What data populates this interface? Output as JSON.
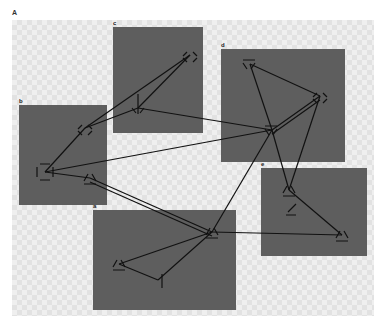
{
  "figure": {
    "panel_label": "A",
    "background": "#efefef",
    "cluster_color": "#5e5e5e",
    "edge_color": "#111111"
  },
  "clusters": [
    {
      "id": "a",
      "label": "a",
      "x": 93,
      "y": 210,
      "w": 143,
      "h": 100
    },
    {
      "id": "b",
      "label": "b",
      "x": 19,
      "y": 105,
      "w": 88,
      "h": 100
    },
    {
      "id": "c",
      "label": "c",
      "x": 113,
      "y": 27,
      "w": 90,
      "h": 106
    },
    {
      "id": "d",
      "label": "d",
      "x": 221,
      "y": 49,
      "w": 124,
      "h": 113
    },
    {
      "id": "e",
      "label": "e",
      "x": 261,
      "y": 168,
      "w": 106,
      "h": 88
    }
  ],
  "nodes": [
    {
      "id": "c1",
      "cluster": "c",
      "shape": "diamond",
      "x": 190,
      "y": 55
    },
    {
      "id": "c2",
      "cluster": "c",
      "shape": "arrow-down",
      "x": 138,
      "y": 108
    },
    {
      "id": "b1",
      "cluster": "b",
      "shape": "diamond",
      "x": 85,
      "y": 128
    },
    {
      "id": "b2",
      "cluster": "b",
      "shape": "square",
      "x": 45,
      "y": 172
    },
    {
      "id": "b3",
      "cluster": "b",
      "shape": "triangle",
      "x": 90,
      "y": 178
    },
    {
      "id": "d1",
      "cluster": "d",
      "shape": "triangle-down",
      "x": 250,
      "y": 64
    },
    {
      "id": "d2",
      "cluster": "d",
      "shape": "diamond",
      "x": 320,
      "y": 96
    },
    {
      "id": "d3",
      "cluster": "d",
      "shape": "triangle-down",
      "x": 272,
      "y": 130
    },
    {
      "id": "e1",
      "cluster": "e",
      "shape": "triangle",
      "x": 289,
      "y": 190
    },
    {
      "id": "e2",
      "cluster": "e",
      "shape": "z",
      "x": 292,
      "y": 208
    },
    {
      "id": "e3",
      "cluster": "e",
      "shape": "triangle",
      "x": 342,
      "y": 235
    },
    {
      "id": "a1",
      "cluster": "a",
      "shape": "triangle",
      "x": 212,
      "y": 232
    },
    {
      "id": "a2",
      "cluster": "a",
      "shape": "triangle",
      "x": 119,
      "y": 264
    },
    {
      "id": "a3",
      "cluster": "a",
      "shape": "triangle-side",
      "x": 158,
      "y": 280
    }
  ],
  "edges": [
    [
      "c1",
      "b1"
    ],
    [
      "c1",
      "c2"
    ],
    [
      "b1",
      "c2"
    ],
    [
      "c2",
      "d3"
    ],
    [
      "b2",
      "d3"
    ],
    [
      "b2",
      "b1"
    ],
    [
      "b2",
      "b3"
    ],
    [
      "b3",
      "a1"
    ],
    [
      "b3",
      "a1b"
    ],
    [
      "d1",
      "d3"
    ],
    [
      "d1",
      "d2"
    ],
    [
      "d2",
      "d3"
    ],
    [
      "d2",
      "d3b"
    ],
    [
      "d2",
      "e1"
    ],
    [
      "d3",
      "e1"
    ],
    [
      "d3",
      "a1"
    ],
    [
      "e1",
      "e3"
    ],
    [
      "a1",
      "e3"
    ],
    [
      "a1",
      "a2"
    ],
    [
      "a1",
      "a3"
    ],
    [
      "a2",
      "a3"
    ]
  ]
}
